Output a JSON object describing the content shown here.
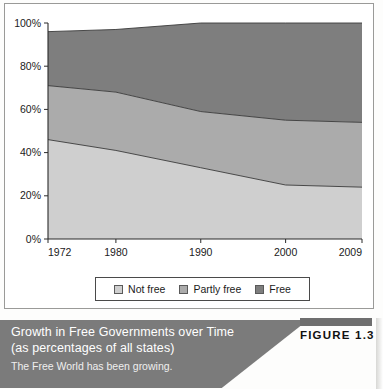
{
  "chart_data": {
    "type": "area",
    "stacked": true,
    "title": "Growth in Free Governments over Time",
    "subtitle": "(as percentages of all states)",
    "xlabel": "",
    "ylabel": "",
    "x": [
      1972,
      1980,
      1990,
      2000,
      2009
    ],
    "xticklabels": [
      "1972",
      "1980",
      "1990",
      "2000",
      "2009"
    ],
    "yticklabels": [
      "0%",
      "20%",
      "40%",
      "60%",
      "80%",
      "100%"
    ],
    "yticks": [
      0,
      20,
      40,
      60,
      80,
      100
    ],
    "ylim": [
      0,
      100
    ],
    "grid": false,
    "legend_position": "bottom",
    "series": [
      {
        "name": "Not free",
        "values": [
          46,
          41,
          33,
          25,
          24
        ],
        "color": "#cfcfcf"
      },
      {
        "name": "Partly free",
        "values": [
          25,
          27,
          26,
          30,
          30
        ],
        "color": "#ababab"
      },
      {
        "name": "Free",
        "values": [
          25,
          29,
          41,
          45,
          46
        ],
        "color": "#7e7e7e"
      }
    ],
    "cumulative_tops": {
      "not_free": [
        46,
        41,
        33,
        25,
        24
      ],
      "partly_free": [
        71,
        68,
        59,
        55,
        54
      ],
      "free": [
        96,
        98,
        100,
        100,
        100
      ]
    }
  },
  "legend": {
    "items": [
      {
        "label": "Not free",
        "color": "#cfcfcf"
      },
      {
        "label": "Partly free",
        "color": "#ababab"
      },
      {
        "label": "Free",
        "color": "#7e7e7e"
      }
    ]
  },
  "caption": {
    "title_line1": "Growth in Free Governments over Time",
    "title_line2": "(as percentages of all states)",
    "subtitle": "The Free World has been growing.",
    "figure_label": "FIGURE 1.3"
  },
  "colors": {
    "not_free": "#cfcfcf",
    "partly_free": "#ababab",
    "free": "#7e7e7e",
    "caption_bar": "#7b7b7b",
    "axis": "#333333"
  }
}
